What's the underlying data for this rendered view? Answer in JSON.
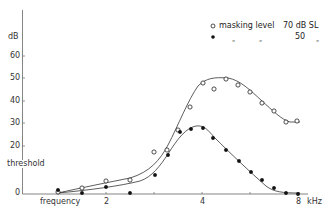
{
  "chart_data": {
    "type": "line",
    "title": "",
    "xlabel": "frequency",
    "x_unit": "kHz",
    "ylabel": "threshold",
    "y_unit": "dB",
    "x_scale": "log2",
    "x_ticks": [
      {
        "value": 1.41,
        "label": ""
      },
      {
        "value": 2,
        "label": "2"
      },
      {
        "value": 2.83,
        "label": ""
      },
      {
        "value": 4,
        "label": "4"
      },
      {
        "value": 5.66,
        "label": ""
      },
      {
        "value": 8,
        "label": "8"
      }
    ],
    "y_ticks": [
      {
        "value": 0,
        "label": "0"
      },
      {
        "value": 20,
        "label": "20"
      },
      {
        "value": 30,
        "label": "30"
      },
      {
        "value": 40,
        "label": "40"
      },
      {
        "value": 50,
        "label": "50"
      },
      {
        "value": 60,
        "label": "60"
      }
    ],
    "ylim": [
      0,
      68
    ],
    "xlim": [
      0.85,
      9.5
    ],
    "grid": false,
    "legend_position": "top-right",
    "legend": [
      {
        "marker": "open-circle",
        "text": "masking level",
        "value": "70 dB SL"
      },
      {
        "marker": "filled-circle",
        "text": "„",
        "value": "50",
        "suffix": "„"
      }
    ],
    "series": [
      {
        "name": "masking level 70 dB SL",
        "marker": "open-circle",
        "x": [
          1.0,
          1.19,
          1.41,
          1.68,
          2.0,
          2.19,
          2.38,
          2.59,
          2.83,
          3.08,
          3.36,
          3.66,
          4.0,
          4.36,
          4.76,
          5.19,
          5.66,
          6.17,
          6.73,
          7.34,
          8.0
        ],
        "points": [
          {
            "f": 1.0,
            "db": 0.5
          },
          {
            "f": 1.19,
            "db": 2.0
          },
          {
            "f": 1.41,
            "db": 5.0
          },
          {
            "f": 1.68,
            "db": 5.5
          },
          {
            "f": 2.0,
            "db": 18.0
          },
          {
            "f": 2.19,
            "db": 19.0
          },
          {
            "f": 2.38,
            "db": 28.0
          },
          {
            "f": 2.59,
            "db": 38.0
          },
          {
            "f": 2.83,
            "db": 48.5
          },
          {
            "f": 3.08,
            "db": 46.0
          },
          {
            "f": 3.36,
            "db": 50.0
          },
          {
            "f": 3.66,
            "db": 47.5
          },
          {
            "f": 4.0,
            "db": 44.5
          },
          {
            "f": 4.36,
            "db": 39.5
          },
          {
            "f": 4.76,
            "db": 36.0
          },
          {
            "f": 5.19,
            "db": 31.5
          },
          {
            "f": 5.66,
            "db": 31.5
          }
        ]
      },
      {
        "name": "masking level 50 dB SL",
        "marker": "filled-circle",
        "points": [
          {
            "f": 1.0,
            "db": 1.5
          },
          {
            "f": 1.19,
            "db": 0.0
          },
          {
            "f": 1.41,
            "db": 2.5
          },
          {
            "f": 1.68,
            "db": 0.0
          },
          {
            "f": 2.0,
            "db": 8.0
          },
          {
            "f": 2.19,
            "db": 16.5
          },
          {
            "f": 2.38,
            "db": 27.0
          },
          {
            "f": 2.59,
            "db": 28.0
          },
          {
            "f": 2.83,
            "db": 28.5
          },
          {
            "f": 3.08,
            "db": 24.0
          },
          {
            "f": 3.36,
            "db": 19.0
          },
          {
            "f": 3.66,
            "db": 14.0
          },
          {
            "f": 4.0,
            "db": 9.5
          },
          {
            "f": 4.36,
            "db": 6.0
          },
          {
            "f": 4.76,
            "db": 2.0
          },
          {
            "f": 5.19,
            "db": 0.0
          },
          {
            "f": 5.66,
            "db": -0.5
          }
        ]
      }
    ]
  },
  "layout_points_px": {
    "open": [
      [
        58,
        192
      ],
      [
        82,
        188
      ],
      [
        106,
        181
      ],
      [
        130,
        180
      ],
      [
        154,
        152
      ],
      [
        167,
        150
      ],
      [
        178,
        130
      ],
      [
        190,
        107
      ],
      [
        203,
        83
      ],
      [
        214,
        89
      ],
      [
        226,
        79
      ],
      [
        238,
        85
      ],
      [
        250,
        92
      ],
      [
        262,
        103
      ],
      [
        274,
        111
      ],
      [
        286,
        122
      ],
      [
        297,
        121
      ]
    ],
    "filled": [
      [
        58,
        190
      ],
      [
        82,
        193
      ],
      [
        106,
        187
      ],
      [
        130,
        193
      ],
      [
        155,
        175
      ],
      [
        168,
        155
      ],
      [
        180,
        132
      ],
      [
        191,
        129
      ],
      [
        203,
        128
      ],
      [
        213,
        138
      ],
      [
        226,
        150
      ],
      [
        239,
        161
      ],
      [
        251,
        172
      ],
      [
        262,
        180
      ],
      [
        274,
        188
      ],
      [
        286,
        193
      ],
      [
        298,
        194
      ]
    ]
  },
  "labels": {
    "y_unit": "dB",
    "y_title": "threshold",
    "x_title": "frequency",
    "x_unit": "kHz",
    "y_tick_labels": [
      "60",
      "50",
      "40",
      "30",
      "20",
      "0"
    ],
    "x_tick_labels": [
      "2",
      "4",
      "8"
    ],
    "legend_1_text": "masking level",
    "legend_1_value": "70 dB SL",
    "legend_2_ditto_1": "„",
    "legend_2_ditto_2": "„",
    "legend_2_value": "50",
    "legend_2_ditto_3": "„"
  },
  "colors": {
    "ink": "#222222",
    "axis": "#555555",
    "background": "#ffffff"
  }
}
